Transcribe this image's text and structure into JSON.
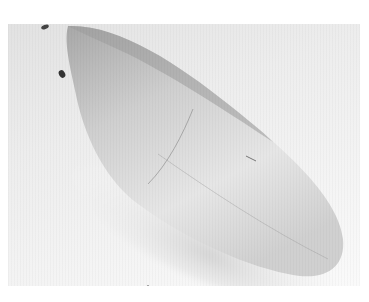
{
  "image": {
    "subject": "shoe-last",
    "description": "Grayscale photograph of a smooth, elongated shoe last lying diagonally from upper-left to lower-right",
    "colors": {
      "background": "#ffffff",
      "photo_background": "#ececec",
      "object_shadow": "#9a9a9a",
      "object_highlight": "#f2f2f2",
      "marks": "#333333"
    }
  }
}
